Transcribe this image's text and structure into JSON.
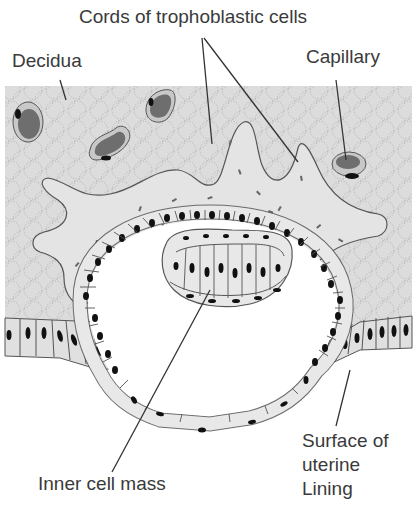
{
  "labels": {
    "cords": "Cords of trophoblastic cells",
    "decidua": "Decidua",
    "capillary": "Capillary",
    "inner_cell_mass": "Inner cell mass",
    "surface_line1": "Surface of",
    "surface_line2": "uterine",
    "surface_line3": "Lining"
  },
  "colors": {
    "decidua_fill": "#dcdcdc",
    "decidua_cell_stroke": "#a8a8a8",
    "trophoblast_fill": "#e4e4e4",
    "cell_fill": "#e8e8e8",
    "cell_stroke": "#555555",
    "nucleus": "#111111",
    "capillary_outer": "#c8c8c8",
    "capillary_inner": "#6e6e6e",
    "leader_line": "#333333",
    "text": "#3a3a3a"
  }
}
